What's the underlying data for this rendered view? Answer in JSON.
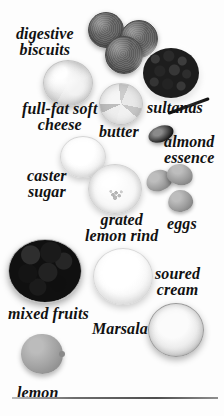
{
  "page": {
    "kind": "cookbook-ingredients-photo",
    "background_color": "#fdfdfd",
    "width": 224,
    "height": 416,
    "palette": "grayscale"
  },
  "labels": [
    {
      "id": "digestive-biscuits",
      "text": "digestive\nbiscuits",
      "x": 16,
      "y": 26,
      "size": 11
    },
    {
      "id": "sultanas",
      "text": "sultanas",
      "x": 147,
      "y": 100,
      "size": 11
    },
    {
      "id": "full-fat-soft-cheese",
      "text": "full-fat soft\ncheese",
      "x": 22,
      "y": 101,
      "size": 11
    },
    {
      "id": "butter",
      "text": "butter",
      "x": 99,
      "y": 124,
      "size": 11
    },
    {
      "id": "almond-essence",
      "text": "almond\nessence",
      "x": 164,
      "y": 134,
      "size": 11
    },
    {
      "id": "caster-sugar",
      "text": "caster\nsugar",
      "x": 27,
      "y": 168,
      "size": 11
    },
    {
      "id": "grated-lemon-rind",
      "text": "grated\nlemon rind",
      "x": 85,
      "y": 212,
      "size": 11
    },
    {
      "id": "eggs",
      "text": "eggs",
      "x": 167,
      "y": 216,
      "size": 11
    },
    {
      "id": "soured-cream",
      "text": "soured\ncream",
      "x": 155,
      "y": 266,
      "size": 11
    },
    {
      "id": "mixed-fruits",
      "text": "mixed fruits",
      "x": 8,
      "y": 306,
      "size": 11
    },
    {
      "id": "Marsala",
      "text": "Marsala",
      "x": 92,
      "y": 321,
      "size": 11
    },
    {
      "id": "lemon",
      "text": "lemon",
      "x": 17,
      "y": 385,
      "size": 11
    }
  ],
  "ingredients": [
    {
      "id": "biscuit-1",
      "name": "digestive biscuit"
    },
    {
      "id": "biscuit-2",
      "name": "digestive biscuit"
    },
    {
      "id": "biscuit-3",
      "name": "digestive biscuit"
    },
    {
      "id": "soft-cheese",
      "name": "full-fat soft cheese"
    },
    {
      "id": "sultanas-bowl",
      "name": "sultanas"
    },
    {
      "id": "butter-block",
      "name": "butter"
    },
    {
      "id": "almond-essence-spoon",
      "name": "almond essence on spoon"
    },
    {
      "id": "caster-sugar-bowl",
      "name": "caster sugar"
    },
    {
      "id": "grated-lemon-rind-bowl",
      "name": "grated lemon rind"
    },
    {
      "id": "egg-1",
      "name": "egg"
    },
    {
      "id": "egg-2",
      "name": "egg"
    },
    {
      "id": "egg-3",
      "name": "egg"
    },
    {
      "id": "mixed-fruits-bowl",
      "name": "mixed fruits"
    },
    {
      "id": "soured-cream-bowl",
      "name": "soured cream"
    },
    {
      "id": "marsala-glass",
      "name": "Marsala"
    },
    {
      "id": "lemon-fruit",
      "name": "lemon"
    }
  ],
  "divider": {
    "present": true,
    "x": 12,
    "y": 397,
    "width": 206
  }
}
